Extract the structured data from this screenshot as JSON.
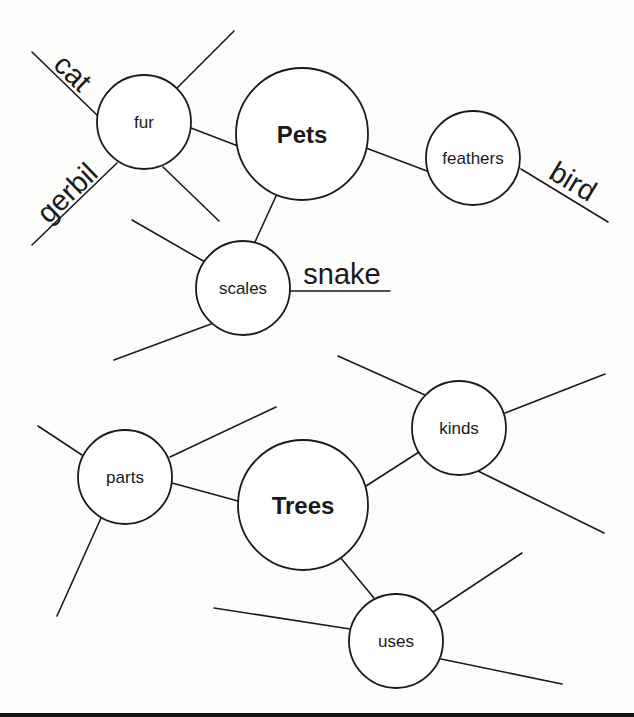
{
  "diagram": {
    "type": "web_organizer",
    "stroke_color": "#1a1a1a",
    "background": "#fdfdfc",
    "webs": [
      {
        "name": "pets-web",
        "hub": {
          "id": "pets",
          "label": "Pets",
          "cx": 302,
          "cy": 134,
          "r": 66
        },
        "branches": [
          {
            "id": "fur",
            "label": "fur",
            "cx": 144,
            "cy": 122,
            "r": 47,
            "link": [
              191,
              128,
              238,
              146
            ],
            "spokes": [
              {
                "answer": "cat",
                "line": [
                  32,
                  52,
                  98,
                  116
                ]
              },
              {
                "answer": "gerbil",
                "line": [
                  32,
                  245,
                  117,
                  163
                ]
              },
              {
                "answer": "",
                "line": [
                  177,
                  88,
                  234,
                  31
                ]
              },
              {
                "answer": "",
                "line": [
                  163,
                  167,
                  219,
                  221
                ]
              }
            ]
          },
          {
            "id": "feathers",
            "label": "feathers",
            "cx": 473,
            "cy": 158,
            "r": 47,
            "link": [
              366,
              148,
              427,
              171
            ],
            "spokes": [
              {
                "answer": "bird",
                "line": [
                  521,
                  169,
                  608,
                  222
                ]
              }
            ]
          },
          {
            "id": "scales",
            "label": "scales",
            "cx": 243,
            "cy": 288,
            "r": 47,
            "link": [
              276,
              196,
              255,
              242
            ],
            "spokes": [
              {
                "answer": "snake",
                "line": [
                  290,
                  291,
                  390,
                  291
                ]
              },
              {
                "answer": "",
                "line": [
                  132,
                  220,
                  205,
                  262
                ]
              },
              {
                "answer": "",
                "line": [
                  114,
                  360,
                  211,
                  324
                ]
              }
            ]
          }
        ]
      },
      {
        "name": "trees-web",
        "hub": {
          "id": "trees",
          "label": "Trees",
          "cx": 303,
          "cy": 505,
          "r": 65
        },
        "branches": [
          {
            "id": "parts",
            "label": "parts",
            "cx": 125,
            "cy": 477,
            "r": 47,
            "link": [
              172,
              483,
              238,
              501
            ],
            "spokes": [
              {
                "answer": "",
                "line": [
                  38,
                  426,
                  82,
                  455
                ]
              },
              {
                "answer": "",
                "line": [
                  170,
                  457,
                  276,
                  407
                ]
              },
              {
                "answer": "",
                "line": [
                  101,
                  518,
                  57,
                  616
                ]
              }
            ]
          },
          {
            "id": "kinds",
            "label": "kinds",
            "cx": 459,
            "cy": 428,
            "r": 47,
            "link": [
              366,
              486,
              419,
              452
            ],
            "spokes": [
              {
                "answer": "",
                "line": [
                  338,
                  356,
                  425,
                  395
                ]
              },
              {
                "answer": "",
                "line": [
                  505,
                  413,
                  605,
                  374
                ]
              },
              {
                "answer": "",
                "line": [
                  478,
                  471,
                  604,
                  533
                ]
              }
            ]
          },
          {
            "id": "uses",
            "label": "uses",
            "cx": 396,
            "cy": 641,
            "r": 47,
            "link": [
              340,
              557,
              374,
              598
            ],
            "spokes": [
              {
                "answer": "",
                "line": [
                  214,
                  608,
                  350,
                  629
                ]
              },
              {
                "answer": "",
                "line": [
                  433,
                  612,
                  522,
                  553
                ]
              },
              {
                "answer": "",
                "line": [
                  441,
                  659,
                  562,
                  684
                ]
              }
            ]
          }
        ]
      }
    ],
    "answers": [
      {
        "text": "cat",
        "x": 66,
        "y": 80,
        "rotate": 44
      },
      {
        "text": "gerbil",
        "x": 74,
        "y": 200,
        "rotate": -44
      },
      {
        "text": "bird",
        "x": 568,
        "y": 190,
        "rotate": 31
      },
      {
        "text": "snake",
        "x": 342,
        "y": 284,
        "rotate": 0
      }
    ]
  }
}
